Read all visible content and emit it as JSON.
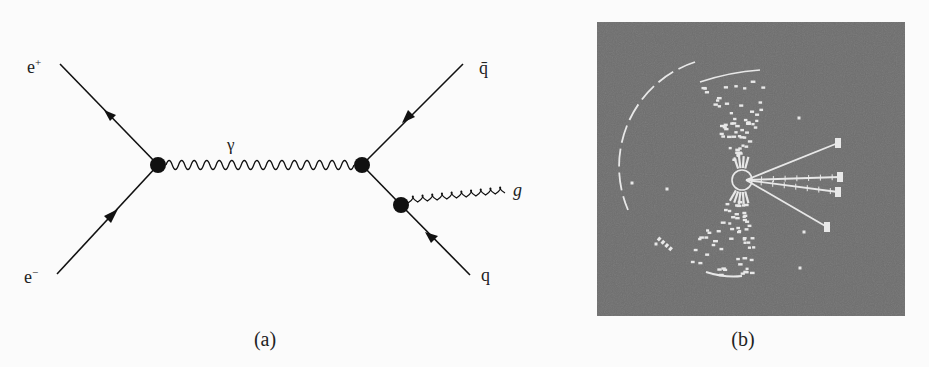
{
  "figure": {
    "panel_a": {
      "caption": "(a)",
      "title": "Feynman diagram: e+ e- annihilation to q qbar with gluon radiation",
      "particles": {
        "positron": "e",
        "positron_sup": "+",
        "electron": "e",
        "electron_sup": "−",
        "photon": "γ",
        "antiquark": "q̄",
        "quark": "q",
        "gluon": "g"
      },
      "propagators": [
        {
          "from": "e+",
          "to": "vertex-1",
          "type": "fermion",
          "arrow": "toward e+"
        },
        {
          "from": "e-",
          "to": "vertex-1",
          "type": "fermion",
          "arrow": "toward vertex"
        },
        {
          "from": "vertex-1",
          "to": "vertex-2",
          "type": "photon (wavy)"
        },
        {
          "from": "qbar",
          "to": "vertex-2",
          "type": "fermion",
          "arrow": "toward vertex"
        },
        {
          "from": "vertex-2",
          "to": "vertex-3",
          "type": "fermion"
        },
        {
          "from": "vertex-3",
          "to": "q",
          "type": "fermion",
          "arrow": "toward q"
        },
        {
          "from": "vertex-3",
          "to": "g",
          "type": "gluon (curly)"
        }
      ]
    },
    "panel_b": {
      "caption": "(b)",
      "title": "Detector event display of a three-jet event",
      "colors": {
        "background": "#6e6e6e",
        "tracks": "#e8e8e8"
      }
    }
  }
}
